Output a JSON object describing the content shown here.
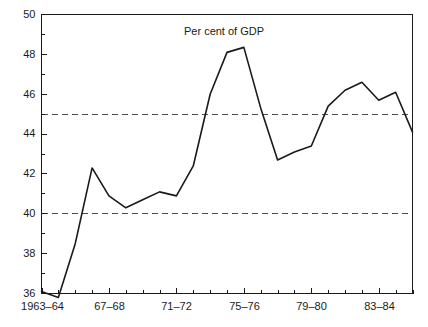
{
  "chart_data": {
    "type": "line",
    "title": "Per cent of GDP",
    "xlabel": "",
    "ylabel": "",
    "ylim": [
      36,
      50
    ],
    "ytick_step": 2,
    "yticks": [
      36,
      38,
      40,
      42,
      44,
      46,
      48,
      50
    ],
    "ytick_labels": [
      "36",
      "38",
      "40",
      "42",
      "44",
      "46",
      "48",
      "50"
    ],
    "yminor_ticks": [
      37,
      39,
      41,
      43,
      45,
      47,
      49
    ],
    "grid": false,
    "legend": null,
    "legend_position": "none",
    "reference_lines": [
      {
        "value": 45,
        "style": "dashed"
      },
      {
        "value": 40,
        "style": "dashed"
      }
    ],
    "categories": [
      "1963-64",
      "1964-65",
      "1965-66",
      "1966-67",
      "1967-68",
      "1968-69",
      "1969-70",
      "1970-71",
      "1971-72",
      "1972-73",
      "1973-74",
      "1974-75",
      "1975-76",
      "1976-77",
      "1977-78",
      "1978-79",
      "1979-80",
      "1980-81",
      "1981-82",
      "1982-83",
      "1983-84",
      "1984-85",
      "1985-86"
    ],
    "xtick_labels": [
      {
        "index": 0,
        "label": "1963–64"
      },
      {
        "index": 4,
        "label": "67–68"
      },
      {
        "index": 8,
        "label": "71–72"
      },
      {
        "index": 12,
        "label": "75–76"
      },
      {
        "index": 16,
        "label": "79–80"
      },
      {
        "index": 20,
        "label": "83–84"
      }
    ],
    "values": [
      36.1,
      35.8,
      38.5,
      42.3,
      40.9,
      40.3,
      40.7,
      41.1,
      40.9,
      42.4,
      46.0,
      48.1,
      48.35,
      45.3,
      42.7,
      43.1,
      43.4,
      45.4,
      46.2,
      46.6,
      45.7,
      46.1,
      44.1
    ],
    "series_color": "#1a1a1a",
    "reference_line_color": "#4d4d4d",
    "axis_color": "#1a1a1a",
    "background_color": "#ffffff"
  }
}
